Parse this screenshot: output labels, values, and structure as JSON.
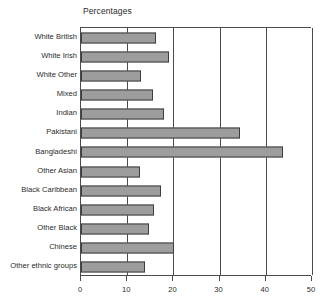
{
  "chart_data": {
    "type": "bar",
    "orientation": "horizontal",
    "title": "Percentages",
    "xlabel": "",
    "ylabel": "",
    "xlim": [
      0,
      50
    ],
    "xticks": [
      0,
      10,
      20,
      30,
      40,
      50
    ],
    "grid": "vertical",
    "legend": "none",
    "bar_color": "#9d9d9d",
    "bar_border_color": "#3d3d3d",
    "axis_color": "#4a4a4a",
    "categories": [
      "White British",
      "White Irish",
      "White Other",
      "Mixed",
      "Indian",
      "Pakistani",
      "Bangladeshi",
      "Other Asian",
      "Black Caribbean",
      "Black African",
      "Other Black",
      "Chinese",
      "Other ethnic groups"
    ],
    "values": [
      16.2,
      19,
      13,
      15.6,
      18,
      34.4,
      43.7,
      12.8,
      17.3,
      15.8,
      14.7,
      20.1,
      13.8
    ]
  }
}
